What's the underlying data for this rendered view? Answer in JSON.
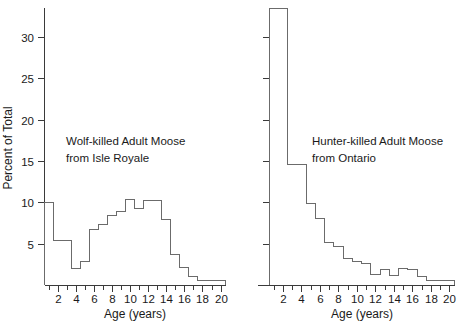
{
  "figure": {
    "background": "#ffffff",
    "line_color": "#6b6b6b",
    "axis_color": "#3a3a3a",
    "text_color": "#1a1a1a"
  },
  "panels": {
    "left": {
      "annotation_line1": "Wolf-killed Adult Moose",
      "annotation_line2": "from Isle Royale",
      "xlabel": "Age (years)",
      "ylabel": "Percent of Total",
      "ytick_labels": [
        "5",
        "10",
        "15",
        "20",
        "25",
        "30"
      ],
      "xtick_labels": [
        "2",
        "4",
        "6",
        "8",
        "10",
        "12",
        "14",
        "16",
        "18",
        "20"
      ]
    },
    "right": {
      "annotation_line1": "Hunter-killed Adult Moose",
      "annotation_line2": "from Ontario",
      "xlabel": "Age (years)",
      "ylabel": "",
      "ytick_labels": [],
      "xtick_labels": [
        "2",
        "4",
        "6",
        "8",
        "10",
        "12",
        "14",
        "16",
        "18",
        "20"
      ]
    }
  },
  "chart_data": [
    {
      "type": "bar",
      "id": "wolf-killed-isle-royale",
      "title": "Wolf-killed Adult Moose from Isle Royale",
      "xlabel": "Age (years)",
      "ylabel": "Percent of Total",
      "xlim": [
        0.6,
        20.6
      ],
      "ylim": [
        0,
        33.5
      ],
      "grid": false,
      "legend": "none",
      "bin_width": 1,
      "xticks": [
        2,
        4,
        6,
        8,
        10,
        12,
        14,
        16,
        18,
        20
      ],
      "xticks_minor": [
        1,
        3,
        5,
        7,
        9,
        11,
        13,
        15,
        17,
        19
      ],
      "yticks": [
        5,
        10,
        15,
        20,
        25,
        30
      ],
      "categories": [
        1,
        2,
        3,
        4,
        5,
        6,
        7,
        8,
        9,
        10,
        11,
        12,
        13,
        14,
        15,
        16,
        17,
        18,
        19,
        20
      ],
      "values": [
        10.0,
        5.4,
        5.4,
        2.0,
        2.9,
        6.7,
        7.3,
        8.4,
        8.9,
        10.3,
        9.3,
        10.2,
        10.2,
        7.9,
        3.7,
        2.1,
        1.0,
        0.5,
        0.5,
        0.5
      ]
    },
    {
      "type": "bar",
      "id": "hunter-killed-ontario",
      "title": "Hunter-killed Adult Moose from Ontario",
      "xlabel": "Age (years)",
      "ylabel": "",
      "xlim": [
        0.6,
        20.6
      ],
      "ylim": [
        0,
        33.5
      ],
      "grid": false,
      "legend": "none",
      "bin_width": 1,
      "xticks": [
        2,
        4,
        6,
        8,
        10,
        12,
        14,
        16,
        18,
        20
      ],
      "xticks_minor": [
        1,
        3,
        5,
        7,
        9,
        11,
        13,
        15,
        17,
        19
      ],
      "yticks": [
        5,
        10,
        15,
        20,
        25,
        30
      ],
      "categories": [
        1,
        2,
        3,
        4,
        5,
        6,
        7,
        8,
        9,
        10,
        11,
        12,
        13,
        14,
        15,
        16,
        17,
        18,
        19,
        20
      ],
      "values": [
        33.4,
        33.4,
        14.6,
        14.6,
        9.9,
        8.1,
        5.1,
        4.7,
        3.2,
        2.8,
        2.6,
        1.3,
        1.9,
        1.2,
        2.0,
        1.9,
        1.0,
        0.6,
        0.6,
        0.6
      ]
    }
  ]
}
